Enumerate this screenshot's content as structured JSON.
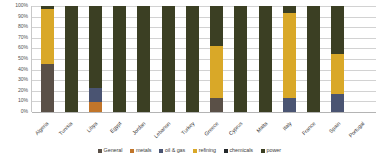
{
  "chart_data": {
    "type": "bar",
    "stacked": true,
    "stack_mode": "percent",
    "title": "",
    "subtitle": "",
    "xlabel": "",
    "ylabel": "",
    "ylim": [
      0,
      100
    ],
    "grid": true,
    "legend_position": "bottom",
    "y_tick_labels": [
      "100%",
      "90%",
      "80%",
      "70%",
      "60%",
      "50%",
      "40%",
      "30%",
      "20%",
      "10%",
      "0%"
    ],
    "y_tick_values": [
      100,
      90,
      80,
      70,
      60,
      50,
      40,
      30,
      20,
      10,
      0
    ],
    "categories": [
      "Algeria",
      "Tunisia",
      "Libya",
      "Egypt",
      "Jordan",
      "Lebanon",
      "Turkey",
      "Greece",
      "Cyprus",
      "Malta",
      "Italy",
      "France",
      "Spain",
      "Portugal"
    ],
    "series": [
      {
        "name": "General",
        "color": "#5a5047",
        "values": [
          45,
          0,
          0,
          0,
          0,
          0,
          0,
          13,
          0,
          0,
          0,
          0,
          0,
          0
        ]
      },
      {
        "name": "metals",
        "color": "#c1752a",
        "values": [
          0,
          0,
          9,
          0,
          0,
          0,
          0,
          0,
          0,
          0,
          0,
          0,
          0,
          0
        ]
      },
      {
        "name": "oil & gas",
        "color": "#4a5472",
        "values": [
          0,
          0,
          14,
          0,
          0,
          0,
          0,
          0,
          0,
          0,
          13,
          0,
          17,
          0
        ]
      },
      {
        "name": "refining",
        "color": "#d9a828",
        "values": [
          52,
          0,
          0,
          0,
          0,
          0,
          0,
          49,
          0,
          0,
          80,
          0,
          38,
          0
        ]
      },
      {
        "name": "chemicals",
        "color": "#23282b",
        "values": [
          0,
          0,
          0,
          0,
          0,
          0,
          0,
          0,
          0,
          0,
          0,
          0,
          0,
          0
        ]
      },
      {
        "name": "power",
        "color": "#3b3f23",
        "values": [
          3,
          100,
          77,
          100,
          100,
          100,
          100,
          38,
          100,
          100,
          7,
          100,
          45,
          0
        ]
      }
    ]
  },
  "legend": {
    "items": [
      {
        "label": "General",
        "color": "#5a5047"
      },
      {
        "label": "metals",
        "color": "#c1752a"
      },
      {
        "label": "oil & gas",
        "color": "#4a5472"
      },
      {
        "label": "refining",
        "color": "#d9a828"
      },
      {
        "label": "chemicals",
        "color": "#23282b"
      },
      {
        "label": "power",
        "color": "#3b3f23"
      }
    ]
  }
}
